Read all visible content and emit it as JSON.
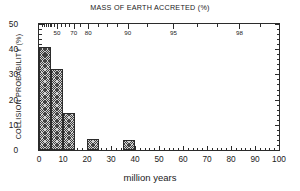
{
  "chart_data": {
    "type": "bar",
    "title": "MASS OF EARTH ACCRETED (%)",
    "xlabel": "million years",
    "ylabel": "COLLISION PROBABILITY (%)",
    "subtitle": "",
    "grid": false,
    "legend": null,
    "xlim": [
      0,
      100
    ],
    "ylim": [
      0,
      50
    ],
    "xticks": [
      0,
      10,
      20,
      30,
      40,
      50,
      60,
      70,
      80,
      90,
      100
    ],
    "xticklabels": [
      "0",
      "10",
      "20",
      "30",
      "40",
      "50",
      "60",
      "70",
      "80",
      "90",
      "100"
    ],
    "xminor_step": 2,
    "yticks": [
      0,
      10,
      20,
      30,
      40,
      50
    ],
    "yticklabels": [
      "0",
      "10",
      "20",
      "30",
      "40",
      "50"
    ],
    "yminor_step": 2,
    "secondary_axis": {
      "position": "top",
      "label": "MASS OF EARTH ACCRETED (%)",
      "ticks": [
        {
          "label": "50",
          "x": 7.5
        },
        {
          "label": "70",
          "x": 14.5
        },
        {
          "label": "80",
          "x": 20.5
        },
        {
          "label": "90",
          "x": 37.0
        },
        {
          "label": "95",
          "x": 56.0
        },
        {
          "label": "98",
          "x": 83.5
        }
      ],
      "minor_ticks_x": [
        1.2,
        2.0,
        2.8,
        3.6,
        4.4,
        5.2,
        6.1,
        7.5,
        9.2,
        11.0,
        12.6,
        14.5,
        17.2,
        20.5,
        24.5,
        28.5,
        32.5,
        37.0,
        45.0,
        56.0,
        66.0,
        74.0,
        83.5,
        92.0
      ]
    },
    "bins": [
      {
        "x0": 0,
        "x1": 5,
        "value": 41.0
      },
      {
        "x0": 5,
        "x1": 10,
        "value": 32.0
      },
      {
        "x0": 10,
        "x1": 15,
        "value": 14.7
      },
      {
        "x0": 20,
        "x1": 25,
        "value": 4.3
      },
      {
        "x0": 35,
        "x1": 40,
        "value": 4.0
      }
    ],
    "categories": [
      "0-5",
      "5-10",
      "10-15",
      "20-25",
      "35-40"
    ],
    "values": [
      41.0,
      32.0,
      14.7,
      4.3,
      4.0
    ],
    "colors": {
      "bar_fill": "#d2d2d2",
      "bar_edge": "#2b2b2b",
      "axis": "#2b2b2b",
      "background": "#ffffff"
    }
  }
}
